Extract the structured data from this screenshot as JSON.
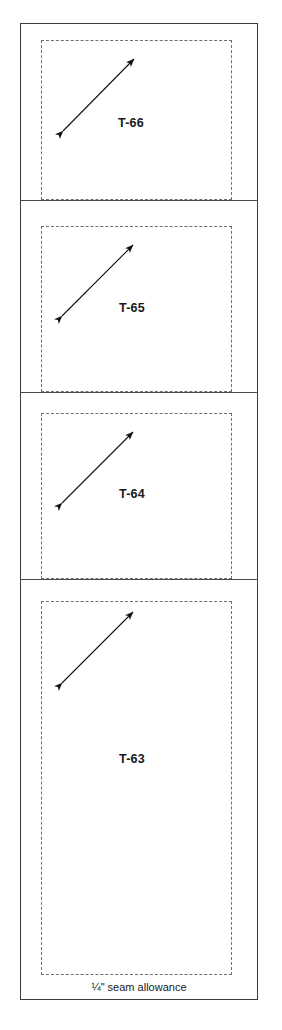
{
  "sheet": {
    "title": "Quilt pattern template sheet",
    "seam_note": "¼\" seam allowance",
    "colors": {
      "paper": "#ffffff",
      "frame_line": "#3c3c3c",
      "divider_line": "#4a4a4a",
      "seam_dashed_line": "#6e6e6e",
      "label_text": "#1a1a1a",
      "arrow": "#111111"
    }
  },
  "pieces": [
    {
      "label": "T-66",
      "grain_arrow_name": "grain-line-arrow",
      "cell": {
        "left": 20,
        "top": 23,
        "width": 238,
        "height": 177
      },
      "seam_rect": {
        "left": 41,
        "top": 40,
        "width": 191,
        "height": 160
      },
      "label_pos": {
        "left": 118,
        "top": 116
      },
      "arrow": {
        "x1": 63,
        "y1": 131,
        "x2": 134,
        "y2": 59
      }
    },
    {
      "label": "T-65",
      "grain_arrow_name": "grain-line-arrow",
      "cell": {
        "left": 20,
        "top": 200,
        "width": 238,
        "height": 192
      },
      "seam_rect": {
        "left": 41,
        "top": 226,
        "width": 191,
        "height": 166
      },
      "label_pos": {
        "left": 119,
        "top": 301
      },
      "arrow": {
        "x1": 62,
        "y1": 316,
        "x2": 133,
        "y2": 245
      }
    },
    {
      "label": "T-64",
      "grain_arrow_name": "grain-line-arrow",
      "cell": {
        "left": 20,
        "top": 392,
        "width": 238,
        "height": 187
      },
      "seam_rect": {
        "left": 41,
        "top": 413,
        "width": 191,
        "height": 166
      },
      "label_pos": {
        "left": 119,
        "top": 487
      },
      "arrow": {
        "x1": 62,
        "y1": 503,
        "x2": 133,
        "y2": 432
      }
    },
    {
      "label": "T-63",
      "grain_arrow_name": "grain-line-arrow",
      "cell": {
        "left": 20,
        "top": 579,
        "width": 238,
        "height": 421
      },
      "seam_rect": {
        "left": 41,
        "top": 601,
        "width": 191,
        "height": 374
      },
      "label_pos": {
        "left": 119,
        "top": 752
      },
      "arrow": {
        "x1": 62,
        "y1": 683,
        "x2": 133,
        "y2": 612
      }
    }
  ],
  "dividers": [
    {
      "top": 200
    },
    {
      "top": 392
    },
    {
      "top": 579
    }
  ],
  "seam_note_pos": {
    "top": 981
  }
}
